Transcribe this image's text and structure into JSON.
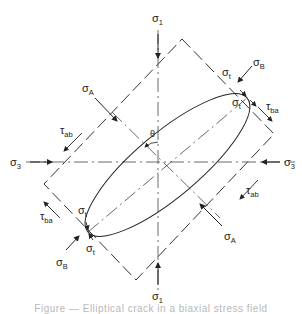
{
  "figure": {
    "labels": {
      "sigma1_top": {
        "sym": "σ",
        "sub": "1"
      },
      "sigma1_bottom": {
        "sym": "σ",
        "sub": "1"
      },
      "sigma3_left": {
        "sym": "σ",
        "sub": "3"
      },
      "sigma3_right": {
        "sym": "σ",
        "sub": "3"
      },
      "sigmaA_upper": {
        "sym": "σ",
        "sub": "A"
      },
      "sigmaA_lower": {
        "sym": "σ",
        "sub": "A"
      },
      "sigmaB_upper": {
        "sym": "σ",
        "sub": "B"
      },
      "sigmaB_lower": {
        "sym": "σ",
        "sub": "B"
      },
      "tau_ab_left": {
        "sym": "τ",
        "sub": "ab"
      },
      "tau_ab_right": {
        "sym": "τ",
        "sub": "ab"
      },
      "tau_ba_left": {
        "sym": "τ",
        "sub": "ba"
      },
      "tau_ba_right": {
        "sym": "τ",
        "sub": "ba"
      },
      "sigma_t_ur_1": {
        "sym": "σ",
        "sub": "t"
      },
      "sigma_t_ur_2": {
        "sym": "σ",
        "sub": "t"
      },
      "sigma_t_ll_1": {
        "sym": "σ",
        "sub": "t"
      },
      "sigma_t_ll_2": {
        "sym": "σ",
        "sub": "t"
      },
      "theta": "θ"
    },
    "caption": "Figure — Elliptical crack in a biaxial stress field"
  }
}
